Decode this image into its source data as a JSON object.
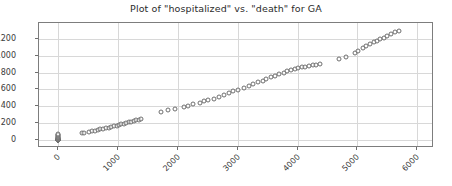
{
  "chart_data": {
    "type": "scatter",
    "title": "Plot of \"hospitalized\" vs. \"death\" for GA",
    "xlabel": "",
    "ylabel": "",
    "xlim": [
      -320,
      6280
    ],
    "ylim": [
      -95,
      1390
    ],
    "grid": true,
    "legend": null,
    "marker": {
      "style": "open-circle",
      "edge_color": "#6e6e6e",
      "size": 5
    },
    "xticks": [
      0,
      1000,
      2000,
      3000,
      4000,
      5000,
      6000
    ],
    "xticklabels": [
      "0",
      "1000",
      "2000",
      "3000",
      "4000",
      "5000",
      "6000"
    ],
    "yticks": [
      0,
      200,
      400,
      600,
      800,
      1000,
      1200
    ],
    "yticklabels": [
      "0",
      "200",
      "400",
      "600",
      "800",
      "1000",
      "1200"
    ],
    "points": [
      [
        0,
        0
      ],
      [
        0,
        0
      ],
      [
        0,
        0
      ],
      [
        0,
        0
      ],
      [
        0,
        0
      ],
      [
        0,
        0
      ],
      [
        0,
        0
      ],
      [
        0,
        0
      ],
      [
        0,
        1
      ],
      [
        0,
        2
      ],
      [
        0,
        4
      ],
      [
        0,
        6
      ],
      [
        0,
        10
      ],
      [
        0,
        13
      ],
      [
        0,
        17
      ],
      [
        0,
        23
      ],
      [
        0,
        25
      ],
      [
        0,
        31
      ],
      [
        0,
        38
      ],
      [
        0,
        47
      ],
      [
        0,
        56
      ],
      [
        0,
        64
      ],
      [
        0,
        69
      ],
      [
        394,
        79
      ],
      [
        438,
        87
      ],
      [
        509,
        94
      ],
      [
        566,
        102
      ],
      [
        617,
        108
      ],
      [
        666,
        116
      ],
      [
        707,
        125
      ],
      [
        754,
        132
      ],
      [
        801,
        139
      ],
      [
        846,
        147
      ],
      [
        888,
        154
      ],
      [
        933,
        163
      ],
      [
        975,
        170
      ],
      [
        1013,
        178
      ],
      [
        1056,
        186
      ],
      [
        1098,
        193
      ],
      [
        1141,
        201
      ],
      [
        1183,
        208
      ],
      [
        1222,
        216
      ],
      [
        1263,
        224
      ],
      [
        1305,
        232
      ],
      [
        1346,
        241
      ],
      [
        1388,
        249
      ],
      [
        1712,
        338
      ],
      [
        1838,
        352
      ],
      [
        1952,
        366
      ],
      [
        2104,
        392
      ],
      [
        2163,
        408
      ],
      [
        2249,
        425
      ],
      [
        2367,
        444
      ],
      [
        2436,
        462
      ],
      [
        2497,
        470
      ],
      [
        2600,
        492
      ],
      [
        2690,
        513
      ],
      [
        2766,
        532
      ],
      [
        2855,
        556
      ],
      [
        2928,
        578
      ],
      [
        3009,
        596
      ],
      [
        3100,
        618
      ],
      [
        3187,
        640
      ],
      [
        3256,
        662
      ],
      [
        3342,
        686
      ],
      [
        3419,
        705
      ],
      [
        3478,
        722
      ],
      [
        3556,
        744
      ],
      [
        3622,
        762
      ],
      [
        3688,
        781
      ],
      [
        3766,
        800
      ],
      [
        3826,
        818
      ],
      [
        3884,
        835
      ],
      [
        3950,
        848
      ],
      [
        4014,
        856
      ],
      [
        4069,
        864
      ],
      [
        4131,
        872
      ],
      [
        4190,
        880
      ],
      [
        4252,
        888
      ],
      [
        4316,
        896
      ],
      [
        4380,
        906
      ],
      [
        4700,
        962
      ],
      [
        4812,
        986
      ],
      [
        4958,
        1030
      ],
      [
        5012,
        1060
      ],
      [
        5096,
        1092
      ],
      [
        5152,
        1118
      ],
      [
        5216,
        1140
      ],
      [
        5272,
        1162
      ],
      [
        5330,
        1180
      ],
      [
        5386,
        1198
      ],
      [
        5440,
        1214
      ],
      [
        5498,
        1236
      ],
      [
        5556,
        1262
      ],
      [
        5622,
        1284
      ],
      [
        5690,
        1300
      ]
    ]
  }
}
